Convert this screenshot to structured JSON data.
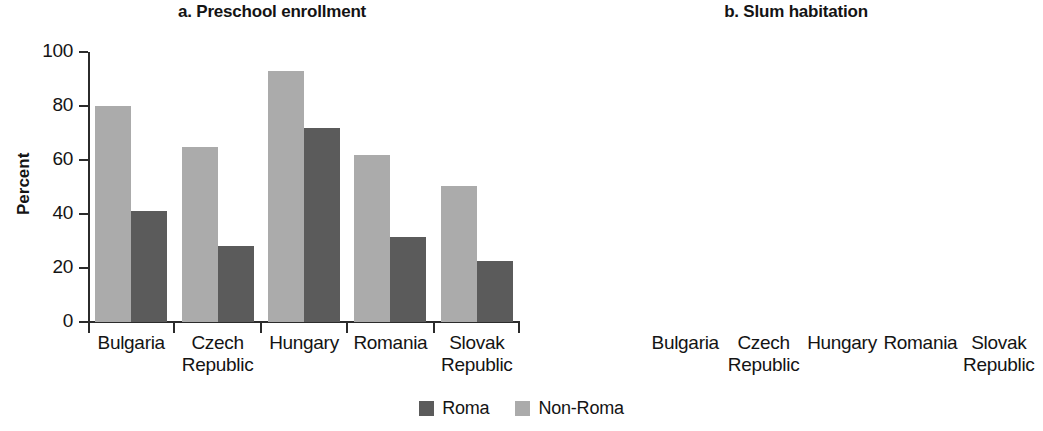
{
  "figure": {
    "legend": {
      "items": [
        {
          "label": "Roma",
          "color": "#5b5b5b",
          "key": "roma"
        },
        {
          "label": "Non-Roma",
          "color": "#ababab",
          "key": "non_roma"
        }
      ]
    }
  },
  "chart_data": [
    {
      "type": "bar",
      "panel": "a",
      "title": "a. Preschool enrollment",
      "xlabel": "",
      "ylabel": "Percent",
      "ylim": [
        0,
        100
      ],
      "yticks": [
        0,
        20,
        40,
        60,
        80,
        100
      ],
      "ytick_labels": [
        "0",
        "20",
        "40",
        "60",
        "80",
        "100"
      ],
      "grid": false,
      "legend_position": "bottom-center",
      "categories": [
        "Bulgaria",
        "Czech Republic",
        "Hungary",
        "Romania",
        "Slovak Republic"
      ],
      "category_lines": [
        [
          "Bulgaria"
        ],
        [
          "Czech",
          "Republic"
        ],
        [
          "Hungary"
        ],
        [
          "Romania"
        ],
        [
          "Slovak",
          "Republic"
        ]
      ],
      "series": [
        {
          "name": "Non-Roma",
          "color": "#ababab",
          "values": [
            80,
            65,
            93,
            62,
            50.5
          ]
        },
        {
          "name": "Roma",
          "color": "#5b5b5b",
          "values": [
            41,
            28,
            72,
            31.5,
            22.5
          ]
        }
      ]
    },
    {
      "type": "bar",
      "panel": "b",
      "title": "b. Slum habitation",
      "xlabel": "",
      "ylabel": "Percent",
      "ylim": [
        0,
        50
      ],
      "yticks": [
        0,
        10,
        20,
        30,
        40,
        50
      ],
      "ytick_labels": [
        "0",
        "10",
        "20",
        "30",
        "40",
        "50"
      ],
      "grid": false,
      "legend_position": "bottom-center",
      "categories": [
        "Bulgaria",
        "Czech Republic",
        "Hungary",
        "Romania",
        "Slovak Republic"
      ],
      "category_lines": [
        [
          "Bulgaria"
        ],
        [
          "Czech",
          "Republic"
        ],
        [
          "Hungary"
        ],
        [
          "Romania"
        ],
        [
          "Slovak",
          "Republic"
        ]
      ],
      "series": [
        {
          "name": "Non-Roma",
          "color": "#ababab",
          "values": [
            3.7,
            1.5,
            17,
            8.8,
            7.6
          ]
        },
        {
          "name": "Roma",
          "color": "#5b5b5b",
          "values": [
            22.2,
            13.6,
            39.2,
            34,
            34.8
          ]
        }
      ]
    }
  ]
}
